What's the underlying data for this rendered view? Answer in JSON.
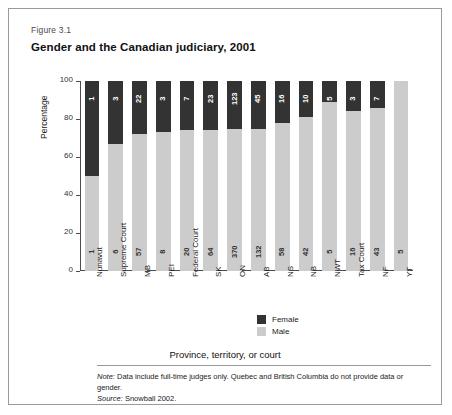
{
  "figure": {
    "number": "Figure 3.1",
    "title": "Gender and the Canadian judiciary, 2001"
  },
  "legend": {
    "female_label": "Female",
    "male_label": "Male",
    "female_color": "#333333",
    "male_color": "#cccccc"
  },
  "footer": {
    "x_axis_title": "Province, territory, or court",
    "note_prefix": "Note:",
    "note_text": " Data include full-time judges only. Quebec and British Columbia do not provide data or gender.",
    "source_prefix": "Source:",
    "source_text": " Snowball 2002."
  },
  "chart_data": {
    "type": "bar",
    "stacked": true,
    "orientation": "vertical",
    "normalized_to_percent": true,
    "title": "Gender and the Canadian judiciary, 2001",
    "xlabel": "Province, territory, or court",
    "ylabel": "Percentage",
    "ylim": [
      0,
      100
    ],
    "yticks": [
      0,
      20,
      40,
      60,
      80,
      100
    ],
    "grid": false,
    "legend_position": "bottom-right",
    "categories": [
      "Nunavut",
      "Supreme Court",
      "MB",
      "PEI",
      "Federal Court",
      "SK",
      "ON",
      "AB",
      "NS",
      "NB",
      "NWT",
      "Tax Court",
      "NF",
      "YT"
    ],
    "series": [
      {
        "name": "Female",
        "color": "#333333",
        "values": [
          1,
          3,
          22,
          3,
          7,
          23,
          123,
          45,
          16,
          10,
          5,
          3,
          7,
          0
        ]
      },
      {
        "name": "Male",
        "color": "#cccccc",
        "values": [
          1,
          6,
          57,
          8,
          20,
          64,
          370,
          132,
          58,
          42,
          5,
          16,
          43,
          5
        ]
      }
    ],
    "bars": [
      {
        "category": "Nunavut",
        "female": 1,
        "male": 1,
        "male_percent": 50
      },
      {
        "category": "Supreme Court",
        "female": 3,
        "male": 6,
        "male_percent": 67
      },
      {
        "category": "MB",
        "female": 22,
        "male": 57,
        "male_percent": 72
      },
      {
        "category": "PEI",
        "female": 3,
        "male": 8,
        "male_percent": 73
      },
      {
        "category": "Federal Court",
        "female": 7,
        "male": 20,
        "male_percent": 74
      },
      {
        "category": "SK",
        "female": 23,
        "male": 64,
        "male_percent": 74
      },
      {
        "category": "ON",
        "female": 123,
        "male": 370,
        "male_percent": 75
      },
      {
        "category": "AB",
        "female": 45,
        "male": 132,
        "male_percent": 75
      },
      {
        "category": "NS",
        "female": 16,
        "male": 58,
        "male_percent": 78
      },
      {
        "category": "NB",
        "female": 10,
        "male": 42,
        "male_percent": 81
      },
      {
        "category": "NWT",
        "female": 5,
        "male": 5,
        "male_percent": 89
      },
      {
        "category": "Tax Court",
        "female": 3,
        "male": 16,
        "male_percent": 84
      },
      {
        "category": "NF",
        "female": 7,
        "male": 43,
        "male_percent": 86
      },
      {
        "category": "YT",
        "female": 0,
        "male": 5,
        "male_percent": 100
      }
    ]
  }
}
